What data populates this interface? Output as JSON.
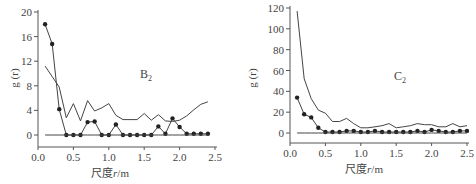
{
  "chart_data": [
    {
      "type": "line",
      "title": "B2",
      "panel_label": "B",
      "panel_sub": "2",
      "xlabel": "尺度r/m",
      "xlabel_prefix": "尺度",
      "xlabel_var": "r",
      "xlabel_unit": "/m",
      "ylabel": "g (r)",
      "xlim": [
        0,
        2.5
      ],
      "ylim": [
        -2,
        20
      ],
      "xticks": [
        "0.0",
        "0.5",
        "1.0",
        "1.5",
        "2.0",
        "2.5"
      ],
      "yticks": [
        "0",
        "4",
        "8",
        "12",
        "16",
        "20"
      ],
      "x": [
        0.1,
        0.2,
        0.3,
        0.4,
        0.5,
        0.6,
        0.7,
        0.8,
        0.9,
        1.0,
        1.1,
        1.2,
        1.3,
        1.4,
        1.5,
        1.6,
        1.7,
        1.8,
        1.9,
        2.0,
        2.1,
        2.2,
        2.3,
        2.4
      ],
      "series": [
        {
          "name": "observed g(r)",
          "marker": "circle",
          "values": [
            18,
            14.8,
            4.2,
            0,
            0,
            0,
            2.1,
            2.2,
            0,
            0,
            1.7,
            0,
            0,
            0,
            0,
            0,
            1.4,
            0.2,
            2.7,
            1.3,
            0.2,
            0.2,
            0.2,
            0.2
          ]
        },
        {
          "name": "upper envelope",
          "marker": "none",
          "values": [
            11.2,
            9.5,
            7.8,
            2.8,
            5.1,
            2.3,
            5.6,
            3.9,
            4.4,
            5.1,
            3.2,
            2.5,
            2.5,
            2.5,
            3.5,
            2.4,
            3.3,
            2.3,
            2.2,
            2.4,
            3.1,
            4.1,
            5.0,
            5.4
          ]
        },
        {
          "name": "lower envelope",
          "marker": "none",
          "values": [
            0,
            0,
            0,
            0,
            0,
            0,
            0,
            0,
            0,
            0,
            0,
            0,
            0,
            0,
            0,
            0,
            0,
            0,
            0,
            0,
            0,
            0,
            0,
            0
          ]
        }
      ],
      "grid": false
    },
    {
      "type": "line",
      "title": "C2",
      "panel_label": "C",
      "panel_sub": "2",
      "xlabel": "尺度r/m",
      "xlabel_prefix": "尺度",
      "xlabel_var": "r",
      "xlabel_unit": "/m",
      "ylabel": "g (r)",
      "xlim": [
        0,
        2.5
      ],
      "ylim": [
        -10,
        120
      ],
      "xticks": [
        "0.0",
        "0.5",
        "1.0",
        "1.5",
        "2.0",
        "2.5"
      ],
      "yticks": [
        "0",
        "20",
        "40",
        "60",
        "80",
        "100",
        "120"
      ],
      "x": [
        0.1,
        0.2,
        0.3,
        0.4,
        0.5,
        0.6,
        0.7,
        0.8,
        0.9,
        1.0,
        1.1,
        1.2,
        1.3,
        1.4,
        1.5,
        1.6,
        1.7,
        1.8,
        1.9,
        2.0,
        2.1,
        2.2,
        2.3,
        2.4,
        2.5
      ],
      "series": [
        {
          "name": "observed g(r)",
          "marker": "circle",
          "values": [
            34,
            18,
            15,
            5,
            1,
            1,
            1,
            2,
            2,
            1,
            1,
            2,
            1,
            1,
            1,
            1,
            1,
            2,
            1,
            3,
            2,
            1,
            1,
            2,
            2
          ]
        },
        {
          "name": "upper envelope",
          "marker": "none",
          "values": [
            117,
            52,
            33,
            22,
            19,
            11,
            11,
            14,
            9,
            5,
            5,
            6,
            7,
            9,
            5,
            6,
            7,
            9,
            8,
            8,
            6,
            6,
            9,
            6,
            7
          ]
        },
        {
          "name": "lower envelope",
          "marker": "none",
          "values": [
            0,
            0,
            0,
            0,
            0,
            0,
            0,
            0,
            0,
            0,
            0,
            0,
            0,
            0,
            0,
            0,
            0,
            0,
            0,
            0,
            0,
            0,
            0,
            0,
            0
          ]
        }
      ],
      "grid": false
    }
  ],
  "colors": {
    "line": "#444444",
    "marker": "#222222",
    "axis": "#555555"
  }
}
